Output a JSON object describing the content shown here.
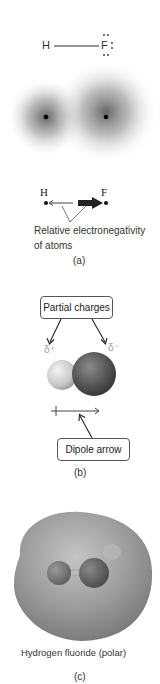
{
  "panel_a": {
    "lewis": {
      "h_label": "H",
      "f_label": "F"
    },
    "clouds": {
      "left_atom": "H",
      "right_atom": "F"
    },
    "electronegativity": {
      "h_label": "H",
      "f_label": "F"
    },
    "caption_line1": "Relative electronegativity",
    "caption_line2": "of atoms",
    "label": "(a)"
  },
  "panel_b": {
    "partial_charges_label": "Partial charges",
    "delta_plus": "δ⁺",
    "delta_minus": "δ⁻",
    "dipole_arrow_label": "Dipole arrow",
    "label": "(b)"
  },
  "panel_c": {
    "caption": "Hydrogen fluoride (polar)",
    "label": "(c)"
  },
  "colors": {
    "cloud": "#6e6e6e",
    "h_sphere": "#d8d8d8",
    "f_sphere": "#5a5a5a",
    "surface": "#9a9a9a",
    "delta_text": "#a0a0a0"
  }
}
